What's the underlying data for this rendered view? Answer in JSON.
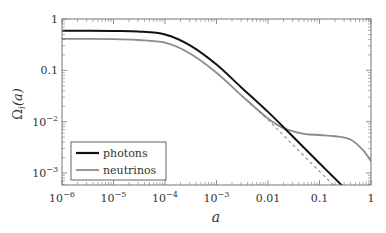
{
  "chart_data": {
    "type": "line",
    "title": "",
    "xlabel": "a",
    "ylabel": "Ω_i(a)",
    "xscale": "log",
    "yscale": "log",
    "xlim": [
      1e-06,
      1
    ],
    "ylim": [
      0.0005,
      1
    ],
    "x_ticks": [
      1e-06,
      1e-05,
      0.0001,
      0.001,
      0.01,
      0.1,
      1
    ],
    "x_tick_labels": [
      "10^-6",
      "10^-5",
      "10^-4",
      "10^-3",
      "0.01",
      "0.1",
      "1"
    ],
    "y_ticks": [
      0.001,
      0.01,
      0.1,
      1
    ],
    "y_tick_labels": [
      "10^-3",
      "10^-2",
      "0.1",
      "1"
    ],
    "grid": false,
    "legend_position": "lower left",
    "series": [
      {
        "name": "photons",
        "color": "#111111",
        "style": "solid",
        "x": [
          1e-06,
          1e-05,
          3e-05,
          0.0001,
          0.0003,
          0.001,
          0.003,
          0.01,
          0.03,
          0.1,
          0.3
        ],
        "y": [
          0.59,
          0.585,
          0.57,
          0.5,
          0.31,
          0.13,
          0.047,
          0.0155,
          0.0052,
          0.00155,
          0.00052
        ]
      },
      {
        "name": "neutrinos",
        "color": "#8c8c8c",
        "style": "solid",
        "x": [
          1e-06,
          1e-05,
          3e-05,
          0.0001,
          0.0003,
          0.001,
          0.003,
          0.01,
          0.02,
          0.05,
          0.1,
          0.2,
          0.4,
          0.7,
          1.0
        ],
        "y": [
          0.41,
          0.405,
          0.39,
          0.345,
          0.215,
          0.09,
          0.033,
          0.0115,
          0.0075,
          0.0058,
          0.0055,
          0.0052,
          0.0045,
          0.0028,
          0.0017
        ]
      },
      {
        "name": "neutrinos (massless extrapolation)",
        "color": "#8c8c8c",
        "style": "dashed",
        "in_legend": false,
        "x": [
          0.003,
          0.01,
          0.03,
          0.1,
          0.2
        ],
        "y": [
          0.033,
          0.0108,
          0.0036,
          0.00108,
          0.00054
        ]
      }
    ]
  },
  "legend": {
    "items": [
      {
        "label": "photons",
        "color": "#111111"
      },
      {
        "label": "neutrinos",
        "color": "#8c8c8c"
      }
    ]
  },
  "axes": {
    "xlabel": "a",
    "ylabel_main": "Ω",
    "ylabel_sub": "i",
    "ylabel_arg": "(a)"
  }
}
